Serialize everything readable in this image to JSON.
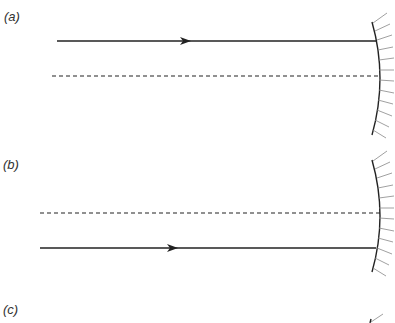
{
  "figure": {
    "panels": [
      {
        "label": "(a)",
        "ray": {
          "y": 41,
          "x1": 57,
          "x2": 377,
          "arrow_x": 185,
          "style": "solid"
        },
        "axis": {
          "y": 76,
          "x1": 52,
          "x2": 379,
          "style": "dashed"
        },
        "mirror": {
          "top": 22,
          "bottom": 135,
          "edge_x": 373,
          "apex_x": 380,
          "type": "concave"
        }
      },
      {
        "label": "(b)",
        "axis": {
          "y": 213,
          "x1": 40,
          "x2": 380,
          "style": "dashed"
        },
        "ray": {
          "y": 248,
          "x1": 40,
          "x2": 376,
          "arrow_x": 172,
          "style": "solid"
        },
        "mirror": {
          "top": 160,
          "bottom": 272,
          "edge_x": 373,
          "apex_x": 380,
          "type": "concave"
        }
      },
      {
        "label": "(c)"
      }
    ],
    "colors": {
      "line": "#222222",
      "hatch": "#888888",
      "label": "#333333"
    }
  }
}
